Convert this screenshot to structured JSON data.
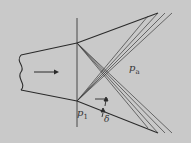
{
  "diagram": {
    "type": "nozzle-expansion-fan",
    "background": "#c9c9c9",
    "stroke": "#2a2a2a",
    "labels": {
      "p_a": "p",
      "p_a_sub": "a",
      "p_1": "p",
      "p_1_sub": "1",
      "delta": "δ"
    },
    "flow_arrow": "right-arrow"
  }
}
